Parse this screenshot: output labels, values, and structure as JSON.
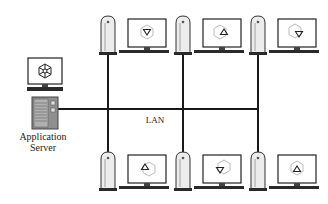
{
  "diagram": {
    "type": "network-topology",
    "network_label": "LAN",
    "server": {
      "label_line1": "Application",
      "label_line2": "Server",
      "monitor_icon": "hexagon-segmented-icon"
    },
    "workstations": [
      {
        "row": "top",
        "position": 1,
        "screen_icon": "hexagon-with-triangle-down-icon"
      },
      {
        "row": "top",
        "position": 2,
        "screen_icon": "hexagon-with-triangle-up-icon"
      },
      {
        "row": "top",
        "position": 3,
        "screen_icon": "hexagon-with-triangle-down-icon"
      },
      {
        "row": "bottom",
        "position": 1,
        "screen_icon": "hexagon-with-triangle-up-icon"
      },
      {
        "row": "bottom",
        "position": 2,
        "screen_icon": "hexagon-with-triangle-down-icon"
      },
      {
        "row": "bottom",
        "position": 3,
        "screen_icon": "hexagon-with-triangle-up-icon"
      }
    ],
    "colors": {
      "line": "#1a1a1a",
      "server_body": "#8a8a8a",
      "tower_body": "#e8e8e8",
      "outline": "#222222"
    }
  }
}
